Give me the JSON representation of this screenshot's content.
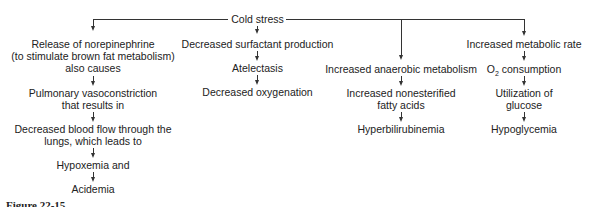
{
  "root": {
    "label": "Cold stress"
  },
  "branches": [
    {
      "nodes": [
        "Release of norepinephrine",
        "(to stimulate brown fat metabolism)",
        "also causes",
        "Pulmonary vasoconstriction",
        "that results in",
        "Decreased blood flow through the",
        "lungs, which leads to",
        "Hypoxemia and",
        "Acidemia"
      ]
    },
    {
      "nodes": [
        "Decreased surfactant production",
        "Atelectasis",
        "Decreased oxygenation"
      ]
    },
    {
      "nodes": [
        "Increased anaerobic metabolism",
        "Increased nonesterified",
        "fatty acids",
        "Hyperbilirubinemia"
      ]
    },
    {
      "nodes": [
        "Increased metabolic rate",
        "O",
        "2",
        " consumption",
        "Utilization of",
        "glucose",
        "Hypoglycemia"
      ]
    }
  ],
  "caption": "Figure 22-15"
}
